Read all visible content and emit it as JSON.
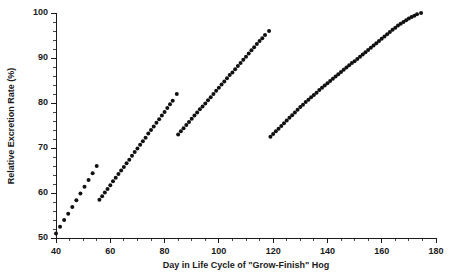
{
  "chart_data": {
    "type": "scatter",
    "title": "",
    "xlabel": "Day in Life Cycle of \"Grow-Finish\" Hog",
    "ylabel": "Relative Excretion Rate (%)",
    "xlim": [
      40,
      180
    ],
    "ylim": [
      50,
      100
    ],
    "grid": false,
    "legend": "none",
    "x_major_ticks": [
      40,
      60,
      80,
      100,
      120,
      140,
      160,
      180
    ],
    "x_tick_labels": [
      "40",
      "60",
      "80",
      "100",
      "120",
      "140",
      "160",
      "180"
    ],
    "x_minor_step": 5,
    "y_major_ticks": [
      50,
      60,
      70,
      80,
      90,
      100
    ],
    "y_tick_labels": [
      "50",
      "60",
      "70",
      "80",
      "90",
      "100"
    ],
    "y_minor_step": 2,
    "marker_color": "#111111",
    "marker_size": 2.0,
    "series": [
      {
        "name": "Phase 1",
        "x": [
          40.0,
          41.5,
          43.0,
          44.5,
          46.0,
          47.5,
          49.0,
          50.5,
          52.0,
          53.5,
          55.0
        ],
        "y": [
          51.0,
          52.5,
          54.0,
          55.4,
          56.9,
          58.4,
          59.9,
          61.4,
          62.9,
          64.4,
          66.0
        ]
      },
      {
        "name": "Phase 2",
        "x": [
          56.0,
          57.0,
          58.0,
          59.0,
          60.0,
          61.0,
          62.0,
          63.0,
          64.0,
          65.0,
          66.0,
          67.0,
          68.0,
          69.0,
          70.0,
          71.0,
          72.0,
          73.0,
          74.0,
          75.0,
          76.0,
          77.0,
          78.0,
          79.0,
          80.0,
          81.0,
          82.0,
          83.0,
          84.5
        ],
        "y": [
          58.5,
          59.3,
          60.1,
          60.9,
          61.7,
          62.6,
          63.4,
          64.2,
          65.0,
          65.8,
          66.6,
          67.4,
          68.3,
          69.1,
          69.9,
          70.7,
          71.5,
          72.3,
          73.2,
          74.0,
          74.8,
          75.6,
          76.4,
          77.2,
          78.0,
          78.9,
          79.7,
          80.5,
          82.0
        ]
      },
      {
        "name": "Phase 3",
        "x": [
          85.0,
          86.0,
          87.0,
          88.0,
          89.0,
          90.0,
          91.0,
          92.0,
          93.0,
          94.0,
          95.0,
          96.0,
          97.0,
          98.0,
          99.0,
          100.0,
          101.0,
          102.0,
          103.0,
          104.0,
          105.0,
          106.0,
          107.0,
          108.0,
          109.0,
          110.0,
          111.0,
          112.0,
          113.0,
          114.0,
          115.0,
          116.0,
          117.0,
          118.5
        ],
        "y": [
          73.0,
          73.7,
          74.4,
          75.1,
          75.8,
          76.5,
          77.2,
          77.9,
          78.6,
          79.2,
          79.9,
          80.6,
          81.3,
          82.0,
          82.7,
          83.4,
          84.1,
          84.8,
          85.5,
          86.2,
          86.8,
          87.5,
          88.2,
          88.9,
          89.6,
          90.3,
          91.0,
          91.7,
          92.4,
          93.1,
          93.8,
          94.4,
          95.1,
          96.0
        ]
      },
      {
        "name": "Phase 4",
        "x": [
          119.0,
          120.0,
          121.0,
          122.0,
          123.0,
          124.0,
          125.0,
          126.0,
          127.0,
          128.0,
          129.0,
          130.0,
          131.0,
          132.0,
          133.0,
          134.0,
          135.0,
          136.0,
          137.0,
          138.0,
          139.0,
          140.0,
          141.0,
          142.0,
          143.0,
          144.0,
          145.0,
          146.0,
          147.0,
          148.0,
          149.0,
          150.0,
          151.0,
          152.0,
          153.0,
          154.0,
          155.0,
          156.0,
          157.0,
          158.0,
          159.0,
          160.0,
          161.0,
          162.0,
          163.0,
          164.0,
          165.0,
          166.0,
          167.0,
          168.0,
          169.0,
          170.0,
          171.0,
          172.0,
          173.0,
          174.5
        ],
        "y": [
          72.5,
          73.1,
          73.7,
          74.3,
          74.9,
          75.5,
          76.1,
          76.7,
          77.3,
          77.9,
          78.5,
          79.1,
          79.6,
          80.2,
          80.7,
          81.3,
          81.8,
          82.3,
          82.9,
          83.4,
          83.9,
          84.4,
          84.9,
          85.4,
          85.9,
          86.4,
          86.9,
          87.4,
          87.9,
          88.4,
          88.9,
          89.3,
          89.8,
          90.3,
          90.8,
          91.3,
          91.8,
          92.3,
          92.8,
          93.3,
          93.8,
          94.3,
          94.8,
          95.3,
          95.8,
          96.3,
          96.7,
          97.2,
          97.6,
          98.0,
          98.4,
          98.8,
          99.1,
          99.4,
          99.7,
          100.0
        ]
      }
    ]
  }
}
